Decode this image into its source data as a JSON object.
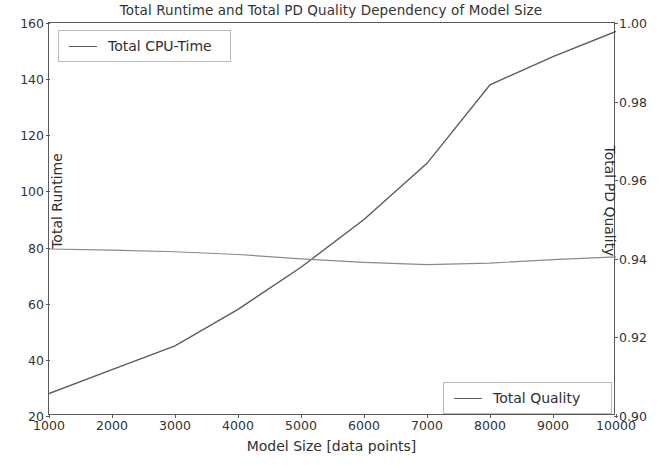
{
  "chart_data": {
    "type": "line",
    "title": "Total Runtime and Total PD Quality Dependency of Model Size",
    "xlabel": "Model Size [data points]",
    "ylabel": "Total Runtime",
    "ylabel_right": "Total PD Quality",
    "x": [
      1000,
      2000,
      3000,
      4000,
      5000,
      6000,
      7000,
      8000,
      9000,
      10000
    ],
    "xlim": [
      1000,
      10000
    ],
    "xticks": [
      "1000",
      "2000",
      "3000",
      "4000",
      "5000",
      "6000",
      "7000",
      "8000",
      "9000",
      "10000"
    ],
    "ylim": [
      20,
      160
    ],
    "yticks": [
      "20",
      "40",
      "60",
      "80",
      "100",
      "120",
      "140",
      "160"
    ],
    "ylim_right": [
      0.9,
      1.0
    ],
    "yticks_right": [
      "0.90",
      "0.92",
      "0.94",
      "0.96",
      "0.98",
      "1.00"
    ],
    "grid": false,
    "legend_position": "upper left and lower right",
    "series": [
      {
        "name": "Total CPU-Time",
        "axis": "left",
        "color": "#5b5b5b",
        "values": [
          28,
          36.5,
          45,
          58,
          73,
          90,
          110,
          138,
          148,
          157
        ]
      },
      {
        "name": "Total Quality",
        "axis": "right",
        "color": "#7d7d7d",
        "values": [
          0.9425,
          0.9422,
          0.9418,
          0.9411,
          0.94,
          0.9391,
          0.9385,
          0.9389,
          0.9398,
          0.9405
        ]
      }
    ]
  },
  "legend": {
    "cpu_label": "Total CPU-Time",
    "quality_label": "Total Quality"
  }
}
